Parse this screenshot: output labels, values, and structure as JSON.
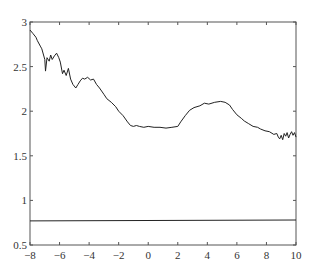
{
  "chart_data": {
    "type": "line",
    "title": "",
    "xlabel": "",
    "ylabel": "",
    "xlim": [
      -8,
      10
    ],
    "ylim": [
      0.5,
      3
    ],
    "grid": false,
    "legend": null,
    "xticks": [
      -8,
      -6,
      -4,
      -2,
      0,
      2,
      4,
      6,
      8,
      10
    ],
    "xtick_labels": [
      "−8",
      "−6",
      "−4",
      "−2",
      "0",
      "2",
      "4",
      "6",
      "8",
      "10"
    ],
    "yticks": [
      0.5,
      1,
      1.5,
      2,
      2.5,
      3
    ],
    "ytick_labels": [
      "0.5",
      "1",
      "1.5",
      "2",
      "2.5",
      "3"
    ],
    "series": [
      {
        "name": "noisy curve",
        "color": "#222222",
        "x": [
          -8.0,
          -7.8,
          -7.6,
          -7.5,
          -7.3,
          -7.2,
          -7.0,
          -6.95,
          -6.85,
          -6.7,
          -6.6,
          -6.5,
          -6.35,
          -6.2,
          -6.05,
          -5.95,
          -5.8,
          -5.7,
          -5.55,
          -5.4,
          -5.25,
          -5.1,
          -4.9,
          -4.75,
          -4.6,
          -4.45,
          -4.3,
          -4.1,
          -3.9,
          -3.7,
          -3.5,
          -3.3,
          -3.0,
          -2.8,
          -2.5,
          -2.2,
          -2.0,
          -1.7,
          -1.4,
          -1.2,
          -1.0,
          -0.8,
          -0.6,
          -0.3,
          0.0,
          0.4,
          0.8,
          1.2,
          1.6,
          2.0,
          2.2,
          2.5,
          2.8,
          3.1,
          3.5,
          3.8,
          4.1,
          4.5,
          4.9,
          5.2,
          5.5,
          5.7,
          6.0,
          6.3,
          6.5,
          6.8,
          7.1,
          7.4,
          7.6,
          7.9,
          8.2,
          8.5,
          8.7,
          8.8,
          8.9,
          9.0,
          9.1,
          9.2,
          9.3,
          9.4,
          9.5,
          9.6,
          9.7,
          9.8,
          9.9,
          10.0
        ],
        "y": [
          2.91,
          2.87,
          2.83,
          2.79,
          2.73,
          2.7,
          2.58,
          2.45,
          2.6,
          2.56,
          2.63,
          2.58,
          2.62,
          2.65,
          2.6,
          2.55,
          2.42,
          2.46,
          2.4,
          2.48,
          2.36,
          2.3,
          2.26,
          2.3,
          2.34,
          2.37,
          2.36,
          2.38,
          2.35,
          2.36,
          2.3,
          2.26,
          2.19,
          2.14,
          2.1,
          2.05,
          2.0,
          1.95,
          1.88,
          1.84,
          1.83,
          1.84,
          1.83,
          1.82,
          1.83,
          1.82,
          1.82,
          1.81,
          1.82,
          1.83,
          1.88,
          1.95,
          2.01,
          2.04,
          2.06,
          2.09,
          2.08,
          2.1,
          2.11,
          2.1,
          2.07,
          2.02,
          1.96,
          1.92,
          1.89,
          1.86,
          1.83,
          1.82,
          1.8,
          1.78,
          1.77,
          1.74,
          1.75,
          1.71,
          1.69,
          1.73,
          1.68,
          1.75,
          1.72,
          1.76,
          1.7,
          1.74,
          1.77,
          1.73,
          1.76,
          1.71
        ]
      },
      {
        "name": "flat line",
        "color": "#222222",
        "x": [
          -8,
          10
        ],
        "y": [
          0.77,
          0.78
        ]
      }
    ]
  }
}
